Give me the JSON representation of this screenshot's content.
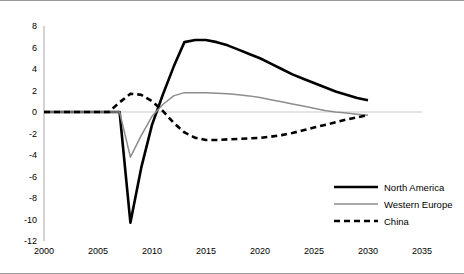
{
  "chart_data": {
    "type": "line",
    "title": "",
    "xlabel": "",
    "ylabel": "",
    "xlim": [
      2000,
      2035
    ],
    "ylim": [
      -12,
      8
    ],
    "grid": false,
    "legend_position": "bottom-right",
    "xticks": [
      "2000",
      "2005",
      "2010",
      "2015",
      "2020",
      "2025",
      "2030",
      "2035"
    ],
    "yticks": [
      "8",
      "6",
      "4",
      "2",
      "0",
      "-2",
      "-4",
      "-6",
      "-8",
      "-10",
      "-12"
    ],
    "x": [
      2000,
      2001,
      2002,
      2003,
      2004,
      2005,
      2006,
      2007,
      2008,
      2009,
      2010,
      2011,
      2012,
      2013,
      2014,
      2015,
      2016,
      2017,
      2018,
      2019,
      2020,
      2021,
      2022,
      2023,
      2024,
      2025,
      2026,
      2027,
      2028,
      2029,
      2030
    ],
    "series": [
      {
        "name": "North America",
        "color": "#000000",
        "style": "solid-thick",
        "values": [
          0,
          0,
          0,
          0,
          0,
          0,
          0,
          0,
          -10.3,
          -5.2,
          -1.2,
          1.6,
          4.2,
          6.5,
          6.7,
          6.7,
          6.5,
          6.2,
          5.8,
          5.4,
          5.0,
          4.5,
          4.0,
          3.5,
          3.1,
          2.7,
          2.3,
          1.9,
          1.6,
          1.3,
          1.1
        ]
      },
      {
        "name": "Western Europe",
        "color": "#8c8c8c",
        "style": "solid-thin",
        "values": [
          0,
          0,
          0,
          0,
          0,
          0,
          0,
          0,
          -4.2,
          -2.2,
          -0.4,
          0.7,
          1.5,
          1.8,
          1.8,
          1.8,
          1.75,
          1.7,
          1.6,
          1.5,
          1.35,
          1.15,
          0.95,
          0.75,
          0.55,
          0.35,
          0.15,
          0.0,
          -0.1,
          -0.2,
          -0.3
        ]
      },
      {
        "name": "China",
        "color": "#000000",
        "style": "dashed",
        "values": [
          0,
          0,
          0,
          0,
          0,
          0,
          0,
          0.9,
          1.7,
          1.6,
          1.0,
          0.1,
          -1.0,
          -1.9,
          -2.4,
          -2.6,
          -2.6,
          -2.55,
          -2.5,
          -2.45,
          -2.4,
          -2.3,
          -2.15,
          -1.95,
          -1.7,
          -1.45,
          -1.2,
          -0.95,
          -0.7,
          -0.5,
          -0.3
        ]
      }
    ]
  },
  "legend": {
    "items": [
      {
        "label": "North America"
      },
      {
        "label": "Western Europe"
      },
      {
        "label": "China"
      }
    ]
  }
}
